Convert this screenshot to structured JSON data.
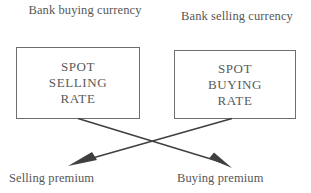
{
  "diagram": {
    "stroke_color": "#6e6e6e",
    "text_color": "#575757",
    "background": "#ffffff",
    "top_labels": {
      "left": "Bank buying currency",
      "right": "Bank selling currency"
    },
    "boxes": [
      {
        "id": "spot-selling-rate",
        "lines": [
          "SPOT",
          "SELLING",
          "RATE"
        ]
      },
      {
        "id": "spot-buying-rate",
        "lines": [
          "SPOT",
          "BUYING",
          "RATE"
        ]
      }
    ],
    "bottom_labels": {
      "left": "Selling premium",
      "right": "Buying premium"
    },
    "connectors": [
      {
        "id": "selling-rate-to-buying-premium",
        "from": "spot-selling-rate",
        "to": "buying-premium",
        "direction": "down-right",
        "arrowhead": true
      },
      {
        "id": "buying-rate-to-selling-premium",
        "from": "spot-buying-rate",
        "to": "selling-premium",
        "direction": "down-left",
        "arrowhead": true
      }
    ]
  }
}
